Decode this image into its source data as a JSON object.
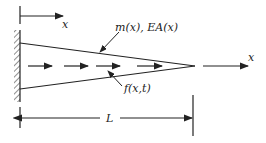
{
  "diagram": {
    "type": "tapered-bar-axial-vibration",
    "labels": {
      "top_axis": "x",
      "right_axis": "x",
      "properties": "m(x), EA(x)",
      "force": "f(x,t)",
      "length": "L"
    },
    "colors": {
      "line": "#222222",
      "background": "#ffffff"
    }
  }
}
